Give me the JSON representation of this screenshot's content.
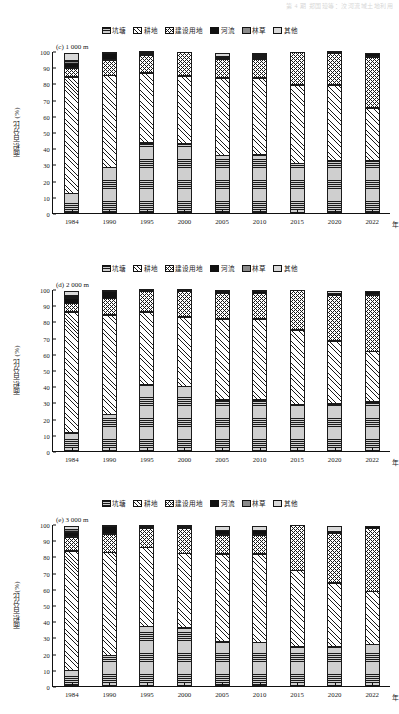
{
  "page_header": "第 4 期    郑国璋等：洨河流域土地利用",
  "legend": {
    "items": [
      {
        "label": "坑塘",
        "key": "pond",
        "pattern": "horizontal-lines",
        "color": "#cfcfcf"
      },
      {
        "label": "耕地",
        "key": "crop",
        "pattern": "diagonal-lines",
        "color": "#ffffff"
      },
      {
        "label": "建设用地",
        "key": "build",
        "pattern": "cross-hatch",
        "color": "#ffffff"
      },
      {
        "label": "河流",
        "key": "river",
        "pattern": "solid",
        "color": "#111111"
      },
      {
        "label": "林草",
        "key": "forest",
        "pattern": "solid",
        "color": "#8a8a8a"
      },
      {
        "label": "其他",
        "key": "other",
        "pattern": "solid",
        "color": "#d9d9d9"
      }
    ]
  },
  "axis": {
    "y_ticks": [
      "0",
      "10",
      "20",
      "30",
      "40",
      "50",
      "60",
      "70",
      "80",
      "90",
      "100"
    ],
    "x_labels": [
      "1984",
      "1990",
      "1995",
      "2000",
      "2005",
      "2010",
      "2015",
      "2020",
      "2022"
    ],
    "x_unit": "年"
  },
  "panels": [
    {
      "tag": "(c) 1 000 m",
      "ylabel": "面积百分比 (%)",
      "chart_index": 0
    },
    {
      "tag": "(d) 2 000 m",
      "ylabel": "面积百分比 (%)",
      "chart_index": 1
    },
    {
      "tag": "(e) 3 000 m",
      "ylabel": "面积百分比(%)",
      "chart_index": 2
    }
  ],
  "chart_data": [
    {
      "type": "bar",
      "stacked": true,
      "title": "(c) 1 000 m",
      "xlabel": "年",
      "ylabel": "面积百分比 (%)",
      "ylim": [
        0,
        100
      ],
      "grid": false,
      "legend_position": "top-center",
      "categories": [
        "1984",
        "1990",
        "1995",
        "2000",
        "2005",
        "2010",
        "2015",
        "2020",
        "2022"
      ],
      "series": [
        {
          "name": "坑塘",
          "values": [
            12.5,
            28.5,
            43.5,
            43.0,
            35.8,
            36.0,
            31.0,
            32.8,
            32.8
          ]
        },
        {
          "name": "耕地",
          "values": [
            72.0,
            57.0,
            43.5,
            42.0,
            48.0,
            48.0,
            48.5,
            46.8,
            32.8
          ]
        },
        {
          "name": "建设用地",
          "values": [
            6.0,
            10.0,
            11.5,
            15.0,
            12.0,
            12.0,
            20.5,
            19.9,
            31.4
          ]
        },
        {
          "name": "河流",
          "values": [
            3.0,
            4.0,
            0.8,
            0.0,
            1.6,
            1.5,
            0.0,
            0.0,
            3.0
          ]
        },
        {
          "name": "林草",
          "values": [
            1.5,
            0.0,
            0.0,
            0.0,
            0.0,
            1.0,
            0.0,
            0.0,
            0.0
          ]
        },
        {
          "name": "其他",
          "values": [
            5.0,
            0.5,
            0.7,
            0.0,
            2.6,
            1.5,
            0.0,
            0.5,
            0.0
          ]
        }
      ]
    },
    {
      "type": "bar",
      "stacked": true,
      "title": "(d) 2 000 m",
      "xlabel": "年",
      "ylabel": "面积百分比 (%)",
      "ylim": [
        0,
        100
      ],
      "grid": false,
      "legend_position": "top-center",
      "categories": [
        "1984",
        "1990",
        "1995",
        "2000",
        "2005",
        "2010",
        "2015",
        "2020",
        "2022"
      ],
      "series": [
        {
          "name": "坑塘",
          "values": [
            11.5,
            23.0,
            41.0,
            40.3,
            31.8,
            31.7,
            28.8,
            29.2,
            30.5
          ]
        },
        {
          "name": "耕地",
          "values": [
            75.0,
            61.5,
            45.5,
            43.0,
            50.2,
            50.3,
            46.7,
            39.5,
            31.5
          ]
        },
        {
          "name": "建设用地",
          "values": [
            5.5,
            10.5,
            13.0,
            16.2,
            16.0,
            16.0,
            24.5,
            28.3,
            35.0
          ]
        },
        {
          "name": "河流",
          "values": [
            3.5,
            4.5,
            0.0,
            0.5,
            1.3,
            1.5,
            0.0,
            0.0,
            3.0
          ]
        },
        {
          "name": "林草",
          "values": [
            1.5,
            0.0,
            0.0,
            0.0,
            0.0,
            0.0,
            0.0,
            1.3,
            0.0
          ]
        },
        {
          "name": "其他",
          "values": [
            3.0,
            0.5,
            0.5,
            0.0,
            0.7,
            0.5,
            0.0,
            1.7,
            0.0
          ]
        }
      ]
    },
    {
      "type": "bar",
      "stacked": true,
      "title": "(e) 3 000 m",
      "xlabel": "年",
      "ylabel": "面积百分比(%)",
      "ylim": [
        0,
        100
      ],
      "grid": false,
      "legend_position": "top-center",
      "categories": [
        "1984",
        "1990",
        "1995",
        "2000",
        "2005",
        "2010",
        "2015",
        "2020",
        "2022"
      ],
      "series": [
        {
          "name": "坑塘",
          "values": [
            10.0,
            19.3,
            37.0,
            36.0,
            27.5,
            27.3,
            24.5,
            24.3,
            26.0
          ]
        },
        {
          "name": "耕地",
          "values": [
            74.0,
            63.7,
            49.0,
            46.5,
            54.5,
            54.7,
            47.3,
            39.9,
            33.0
          ]
        },
        {
          "name": "建设用地",
          "values": [
            9.0,
            11.5,
            12.0,
            15.8,
            12.0,
            12.0,
            28.2,
            31.0,
            39.0
          ]
        },
        {
          "name": "河流",
          "values": [
            3.3,
            5.0,
            1.0,
            0.7,
            3.0,
            3.0,
            0.0,
            0.0,
            2.0
          ]
        },
        {
          "name": "林草",
          "values": [
            1.7,
            0.0,
            0.0,
            0.0,
            0.0,
            0.0,
            0.0,
            1.3,
            0.0
          ]
        },
        {
          "name": "其他",
          "values": [
            2.0,
            0.5,
            1.0,
            1.0,
            3.0,
            3.0,
            0.0,
            3.5,
            0.0
          ]
        }
      ]
    }
  ]
}
